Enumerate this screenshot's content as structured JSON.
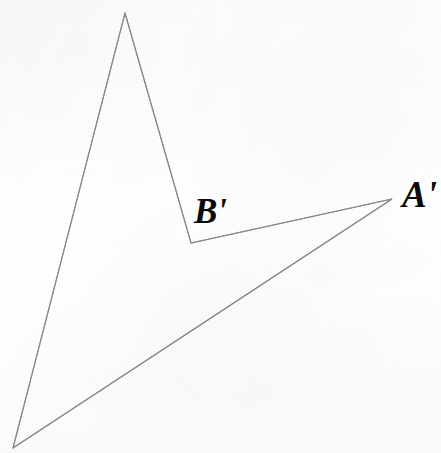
{
  "figure": {
    "kind": "geometry-diagram",
    "canvas": {
      "width": 441,
      "height": 453
    },
    "background_color": "#fdfdfd",
    "stroke_color": "#8a8a8a",
    "stroke_width": 1.1,
    "fill": "none",
    "vertices": [
      {
        "id": "apex",
        "label": "",
        "x": 125,
        "y": 13
      },
      {
        "id": "b-prime",
        "label": "B'",
        "x": 191,
        "y": 243
      },
      {
        "id": "a-prime",
        "label": "A'",
        "x": 392,
        "y": 199
      },
      {
        "id": "bottom-left",
        "label": "",
        "x": 13,
        "y": 448
      }
    ],
    "path": "M 125,13 L 191,243 L 392,199 L 13,448 Z",
    "edges": [
      {
        "from": "apex",
        "to": "b-prime"
      },
      {
        "from": "b-prime",
        "to": "a-prime"
      },
      {
        "from": "a-prime",
        "to": "bottom-left"
      },
      {
        "from": "bottom-left",
        "to": "apex"
      }
    ],
    "labels": [
      {
        "id": "label-b-prime",
        "text": "B'",
        "x": 194,
        "y": 194,
        "font_size": 35,
        "style": "bold-italic",
        "color": "#0a0a0a"
      },
      {
        "id": "label-a-prime",
        "text": "A'",
        "x": 402,
        "y": 176,
        "font_size": 37,
        "style": "bold-italic",
        "color": "#0a0a0a",
        "clipped_at_right_edge": true
      }
    ]
  }
}
